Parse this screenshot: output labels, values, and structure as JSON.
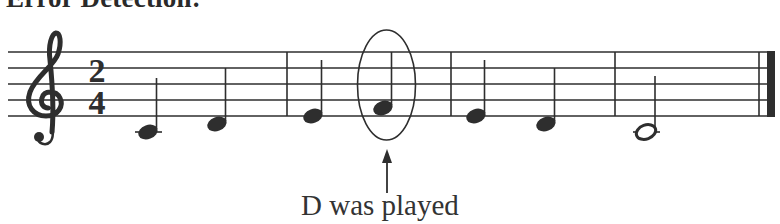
{
  "title": "Error Detection:",
  "caption": "D was played",
  "colors": {
    "ink": "#2e2e2e",
    "background": "#ffffff"
  },
  "score": {
    "clef": "treble-clef",
    "time_signature": {
      "numerator": "2",
      "denominator": "4"
    },
    "measures": [
      {
        "notes": [
          {
            "pitch": "C4",
            "duration": "quarter"
          },
          {
            "pitch": "D4",
            "duration": "quarter"
          }
        ]
      },
      {
        "notes": [
          {
            "pitch": "E4",
            "duration": "quarter"
          },
          {
            "pitch": "F4",
            "duration": "quarter",
            "circled": true
          }
        ]
      },
      {
        "notes": [
          {
            "pitch": "E4",
            "duration": "quarter"
          },
          {
            "pitch": "D4",
            "duration": "quarter"
          }
        ]
      },
      {
        "notes": [
          {
            "pitch": "C4",
            "duration": "half"
          }
        ]
      }
    ],
    "final_barline": "double-final",
    "annotation": {
      "target_note": "F4 in measure 2",
      "marker": "ellipse-with-arrow"
    }
  }
}
